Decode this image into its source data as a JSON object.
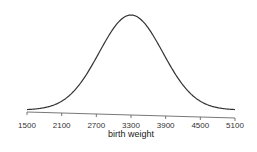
{
  "chart_data": {
    "type": "line",
    "title": "",
    "xlabel": "birth weight",
    "ylabel": "",
    "xlim": [
      1500,
      5100
    ],
    "x_ticks": [
      1500,
      2100,
      2700,
      3300,
      3900,
      4500,
      5100
    ],
    "x_tick_labels": [
      "1500",
      "2100",
      "2700",
      "3300",
      "3900",
      "4500",
      "5100"
    ],
    "y_axis_shown": false,
    "grid": false,
    "legend": null,
    "series": [
      {
        "name": "normal density",
        "distribution": "normal",
        "mean": 3300,
        "sd": 550,
        "x": [
          1500,
          1800,
          2100,
          2400,
          2700,
          3000,
          3300,
          3600,
          3900,
          4200,
          4500,
          4800,
          5100
        ],
        "relative_density": [
          0.005,
          0.024,
          0.092,
          0.262,
          0.551,
          0.862,
          1.0,
          0.862,
          0.551,
          0.262,
          0.092,
          0.024,
          0.005
        ]
      }
    ]
  },
  "colors": {
    "curve": "#333333",
    "axis": "#555555",
    "background": "#ffffff"
  }
}
